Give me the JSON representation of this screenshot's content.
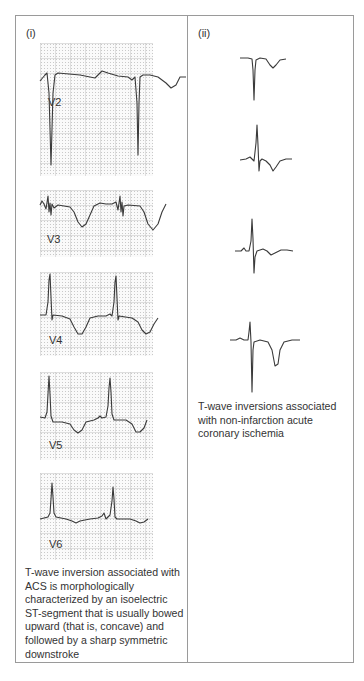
{
  "panels": [
    {
      "label": "(i)",
      "leads": [
        {
          "name": "V2"
        },
        {
          "name": "V3"
        },
        {
          "name": "V4"
        },
        {
          "name": "V5"
        },
        {
          "name": "V6"
        }
      ],
      "caption": "T-wave inversion associated with ACS is morphologically characterized by an isoelectric ST-segment that is usually bowed upward (that is, concave) and followed by a sharp symmetric downstroke"
    },
    {
      "label": "(ii)",
      "traces": [
        {
          "name": "example-1"
        },
        {
          "name": "example-2"
        },
        {
          "name": "example-3"
        },
        {
          "name": "example-4"
        }
      ],
      "caption": "T-wave inversions associated with non-infarction acute coronary ischemia"
    }
  ],
  "colors": {
    "trace": "#3a3a3a",
    "border": "#9a9a9a",
    "grid": "#c9c9c9"
  }
}
